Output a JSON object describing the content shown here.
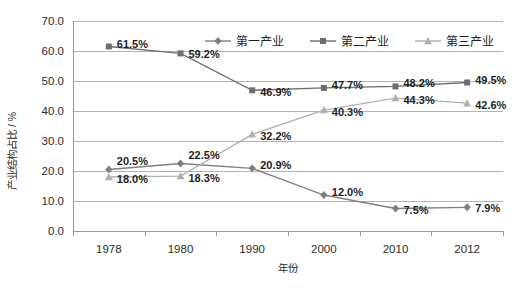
{
  "chart_data": {
    "type": "line",
    "title": "",
    "xlabel": "年份",
    "ylabel": "产业结构占比 / %",
    "categories": [
      "1978",
      "1980",
      "1990",
      "2000",
      "2010",
      "2012"
    ],
    "ylim": [
      0,
      70
    ],
    "ytick_step": 10,
    "ytick_labels": [
      "70.0",
      "60.0",
      "50.0",
      "40.0",
      "30.0",
      "20.0",
      "10.0",
      "0.0"
    ],
    "grid": true,
    "legend_position": "top-center",
    "series": [
      {
        "name": "第一产业",
        "marker": "diamond",
        "color": "#7f7f7f",
        "values": [
          20.5,
          22.5,
          20.9,
          12.0,
          7.5,
          7.9
        ],
        "labels": [
          "20.5%",
          "22.5%",
          "20.9%",
          "12.0%",
          "7.5%",
          "7.9%"
        ]
      },
      {
        "name": "第二产业",
        "marker": "square",
        "color": "#6e6e6e",
        "values": [
          61.5,
          59.2,
          46.9,
          47.7,
          48.2,
          49.5
        ],
        "labels": [
          "61.5%",
          "59.2%",
          "46.9%",
          "47.7%",
          "48.2%",
          "49.5%"
        ]
      },
      {
        "name": "第三产业",
        "marker": "triangle",
        "color": "#b0b0b0",
        "values": [
          18.0,
          18.3,
          32.2,
          40.3,
          44.3,
          42.6
        ],
        "labels": [
          "18.0%",
          "18.3%",
          "32.2%",
          "40.3%",
          "44.3%",
          "42.6%"
        ]
      }
    ]
  },
  "legend": {
    "items": [
      {
        "label": "第一产业"
      },
      {
        "label": "第二产业"
      },
      {
        "label": "第三产业"
      }
    ]
  },
  "axes": {
    "y_title": "产业结构占比 / %",
    "x_title": "年份"
  }
}
